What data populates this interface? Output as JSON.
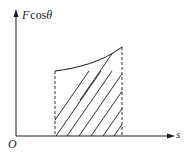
{
  "figure": {
    "type": "work-integral-diagram",
    "colors": {
      "stroke": "#1a1a1a",
      "background": "#ffffff"
    }
  },
  "axes": {
    "y_label": {
      "F": "F",
      "cos": "cos",
      "theta": "θ"
    },
    "x_label": "s",
    "origin_label": "O"
  },
  "geometry": {
    "origin": [
      16,
      136
    ],
    "y_axis_top": 10,
    "x_axis_right": 174,
    "left_bound_x": 55,
    "right_bound_x": 122,
    "curve_start": [
      55,
      71
    ],
    "curve_end": [
      122,
      47
    ],
    "hatch_line_count": 8
  }
}
